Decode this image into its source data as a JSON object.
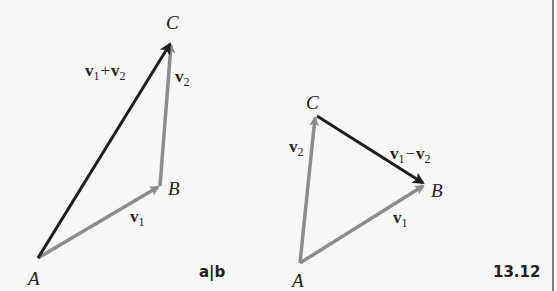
{
  "figure": {
    "number": "13.12",
    "panel_label": "a|b",
    "colors": {
      "component_vector": "#8c8c8c",
      "resultant_vector": "#1e1e1e",
      "background": "#f7f7f5",
      "text": "#222222"
    }
  },
  "panel_a": {
    "title": "Vector addition",
    "points": {
      "A": {
        "label": "A",
        "x": 38,
        "y": 258
      },
      "B": {
        "label": "B",
        "x": 160,
        "y": 186
      },
      "C": {
        "label": "C",
        "x": 172,
        "y": 42
      }
    },
    "vectors": [
      {
        "from": "A",
        "to": "B",
        "label": "v1",
        "style": "component"
      },
      {
        "from": "B",
        "to": "C",
        "label": "v2",
        "style": "component"
      },
      {
        "from": "A",
        "to": "C",
        "label": "v1+v2",
        "style": "resultant"
      }
    ],
    "labels": {
      "v1_main": "v",
      "v1_sub": "1",
      "v2_main": "v",
      "v2_sub": "2",
      "sum_v": "v",
      "sum_sub1": "1",
      "sum_op": "+",
      "sum_sub2": "2"
    }
  },
  "panel_b": {
    "title": "Vector subtraction",
    "points": {
      "A": {
        "label": "A",
        "x": 300,
        "y": 263
      },
      "B": {
        "label": "B",
        "x": 425,
        "y": 185
      },
      "C": {
        "label": "C",
        "x": 316,
        "y": 116
      }
    },
    "vectors": [
      {
        "from": "A",
        "to": "B",
        "label": "v1",
        "style": "component"
      },
      {
        "from": "A",
        "to": "C",
        "label": "v2",
        "style": "component"
      },
      {
        "from": "C",
        "to": "B",
        "label": "v1-v2",
        "style": "resultant"
      }
    ],
    "labels": {
      "v1_main": "v",
      "v1_sub": "1",
      "v2_main": "v",
      "v2_sub": "2",
      "diff_v": "v",
      "diff_sub1": "1",
      "diff_op": "−",
      "diff_sub2": "2"
    }
  }
}
